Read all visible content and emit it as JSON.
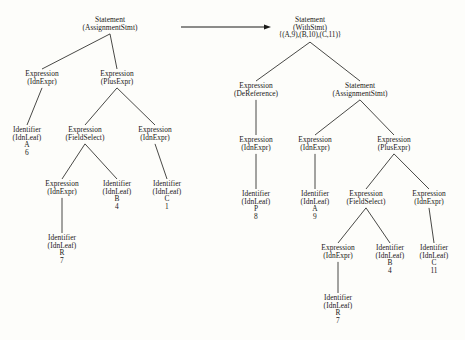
{
  "figure": {
    "background_color": "#fdfdfa",
    "ink_color": "#1a1a18",
    "arrow": {
      "label": "rewrites-to-arrow",
      "from_x": 181,
      "to_x": 271,
      "y": 27
    }
  },
  "trees": [
    {
      "name": "left-tree",
      "root_id": "L0",
      "nodes": [
        {
          "id": "L0",
          "x": 110,
          "y": 16,
          "kind": "Statement",
          "variant": "(AssignmentStmt)"
        },
        {
          "id": "L1",
          "x": 42,
          "y": 70,
          "kind": "Expression",
          "variant": "(IdnExpr)"
        },
        {
          "id": "L2",
          "x": 117,
          "y": 70,
          "kind": "Expression",
          "variant": "(PlusExpr)"
        },
        {
          "id": "L3",
          "x": 27,
          "y": 126,
          "kind": "Identifier",
          "variant": "(IdnLeaf)",
          "symbol": "A",
          "number": "6"
        },
        {
          "id": "L4",
          "x": 85,
          "y": 126,
          "kind": "Expression",
          "variant": "(FieldSelect)"
        },
        {
          "id": "L5",
          "x": 155,
          "y": 126,
          "kind": "Expression",
          "variant": "(IdnExpr)"
        },
        {
          "id": "L6",
          "x": 62,
          "y": 180,
          "kind": "Expression",
          "variant": "(IdnExpr)"
        },
        {
          "id": "L7",
          "x": 117,
          "y": 180,
          "kind": "Identifier",
          "variant": "(IdnLeaf)",
          "symbol": "B",
          "number": "4"
        },
        {
          "id": "L8",
          "x": 167,
          "y": 180,
          "kind": "Identifier",
          "variant": "(IdnLeaf)",
          "symbol": "C",
          "number": "1"
        },
        {
          "id": "L9",
          "x": 62,
          "y": 234,
          "kind": "Identifier",
          "variant": "(IdnLeaf)",
          "symbol": "R",
          "number": "7"
        }
      ],
      "edges": [
        {
          "from": "L0",
          "to": "L1"
        },
        {
          "from": "L0",
          "to": "L2"
        },
        {
          "from": "L1",
          "to": "L3"
        },
        {
          "from": "L2",
          "to": "L4"
        },
        {
          "from": "L2",
          "to": "L5"
        },
        {
          "from": "L4",
          "to": "L6"
        },
        {
          "from": "L4",
          "to": "L7"
        },
        {
          "from": "L5",
          "to": "L8"
        },
        {
          "from": "L6",
          "to": "L9"
        }
      ]
    },
    {
      "name": "right-tree",
      "root_id": "R0",
      "nodes": [
        {
          "id": "R0",
          "x": 310,
          "y": 16,
          "kind": "Statement",
          "variant": "(WithStmt)",
          "environment": "{(A,9),(B,10),(C,11)}"
        },
        {
          "id": "R1",
          "x": 256,
          "y": 82,
          "kind": "Expression",
          "variant": "(DeReference)"
        },
        {
          "id": "R2",
          "x": 360,
          "y": 82,
          "kind": "Statement",
          "variant": "(AssignmentStmt)"
        },
        {
          "id": "R3",
          "x": 256,
          "y": 136,
          "kind": "Expression",
          "variant": "(IdnExpr)"
        },
        {
          "id": "R4",
          "x": 315,
          "y": 136,
          "kind": "Expression",
          "variant": "(IdnExpr)"
        },
        {
          "id": "R5",
          "x": 394,
          "y": 136,
          "kind": "Expression",
          "variant": "(PlusExpr)"
        },
        {
          "id": "R6",
          "x": 256,
          "y": 190,
          "kind": "Identifier",
          "variant": "(IdnLeaf)",
          "symbol": "P",
          "number": "8"
        },
        {
          "id": "R7",
          "x": 315,
          "y": 190,
          "kind": "Identifier",
          "variant": "(IdnLeaf)",
          "symbol": "A",
          "number": "9"
        },
        {
          "id": "R8",
          "x": 366,
          "y": 190,
          "kind": "Expression",
          "variant": "(FieldSelect)"
        },
        {
          "id": "R9",
          "x": 429,
          "y": 190,
          "kind": "Expression",
          "variant": "(IdnExpr)"
        },
        {
          "id": "R10",
          "x": 338,
          "y": 244,
          "kind": "Expression",
          "variant": "(IdnExpr)"
        },
        {
          "id": "R11",
          "x": 390,
          "y": 244,
          "kind": "Identifier",
          "variant": "(IdnLeaf)",
          "symbol": "B",
          "number": "4"
        },
        {
          "id": "R12",
          "x": 434,
          "y": 244,
          "kind": "Identifier",
          "variant": "(IdnLeaf)",
          "symbol": "C",
          "number": "11"
        },
        {
          "id": "R13",
          "x": 338,
          "y": 294,
          "kind": "Identifier",
          "variant": "(IdnLeaf)",
          "symbol": "R",
          "number": "7"
        }
      ],
      "edges": [
        {
          "from": "R0",
          "to": "R1"
        },
        {
          "from": "R0",
          "to": "R2"
        },
        {
          "from": "R1",
          "to": "R3"
        },
        {
          "from": "R2",
          "to": "R4"
        },
        {
          "from": "R2",
          "to": "R5"
        },
        {
          "from": "R3",
          "to": "R6"
        },
        {
          "from": "R4",
          "to": "R7"
        },
        {
          "from": "R5",
          "to": "R8"
        },
        {
          "from": "R5",
          "to": "R9"
        },
        {
          "from": "R8",
          "to": "R10"
        },
        {
          "from": "R8",
          "to": "R11"
        },
        {
          "from": "R9",
          "to": "R12"
        },
        {
          "from": "R10",
          "to": "R13"
        }
      ]
    }
  ]
}
